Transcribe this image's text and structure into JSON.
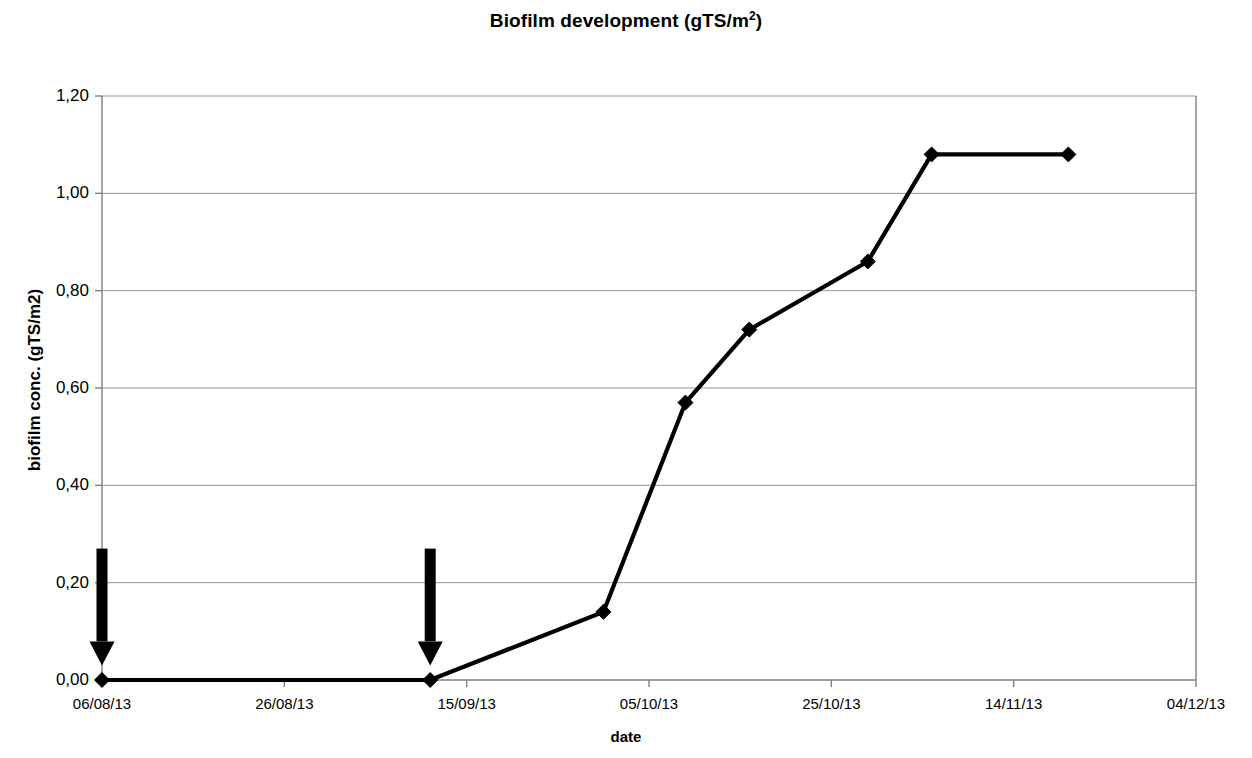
{
  "chart_data": {
    "type": "line",
    "title": "Biofilm development (gTS/m2)",
    "title_main": "Biofilm development (gTS/m",
    "title_sup": "2",
    "title_tail": ")",
    "xlabel": "date",
    "ylabel": "biofilm conc. (gTS/m2)",
    "ylim": [
      0.0,
      1.2
    ],
    "ytick_labels": [
      "1,20",
      "1,00",
      "0,80",
      "0,60",
      "0,40",
      "0,20",
      "0,00"
    ],
    "ytick_values": [
      1.2,
      1.0,
      0.8,
      0.6,
      0.4,
      0.2,
      0.0
    ],
    "xtick_labels": [
      "06/08/13",
      "26/08/13",
      "15/09/13",
      "05/10/13",
      "25/10/13",
      "14/11/13",
      "04/12/13"
    ],
    "xtick_values": [
      0,
      20,
      40,
      60,
      80,
      100,
      120
    ],
    "xlim": [
      0,
      120
    ],
    "grid": "horizontal",
    "legend": "none",
    "series": [
      {
        "name": "biofilm conc.",
        "marker": "diamond",
        "color": "#000000",
        "x": [
          0,
          36,
          55,
          64,
          71,
          84,
          91,
          106
        ],
        "y": [
          0.0,
          0.0,
          0.14,
          0.57,
          0.72,
          0.86,
          1.08,
          1.08
        ],
        "x_dates": [
          "06/08/13",
          "11/09/13",
          "30/09/13",
          "09/10/13",
          "16/10/13",
          "29/10/13",
          "05/11/13",
          "20/11/13"
        ]
      }
    ],
    "annotations": [
      {
        "type": "down-arrow",
        "x": 0,
        "y_top": 0.27,
        "y_tip": 0.03,
        "color": "#000000"
      },
      {
        "type": "down-arrow",
        "x": 36,
        "y_top": 0.27,
        "y_tip": 0.03,
        "color": "#000000"
      }
    ],
    "colors": {
      "line": "#000000",
      "marker": "#000000",
      "grid": "#969696",
      "axis": "#7f7f7f",
      "background": "#ffffff"
    }
  }
}
